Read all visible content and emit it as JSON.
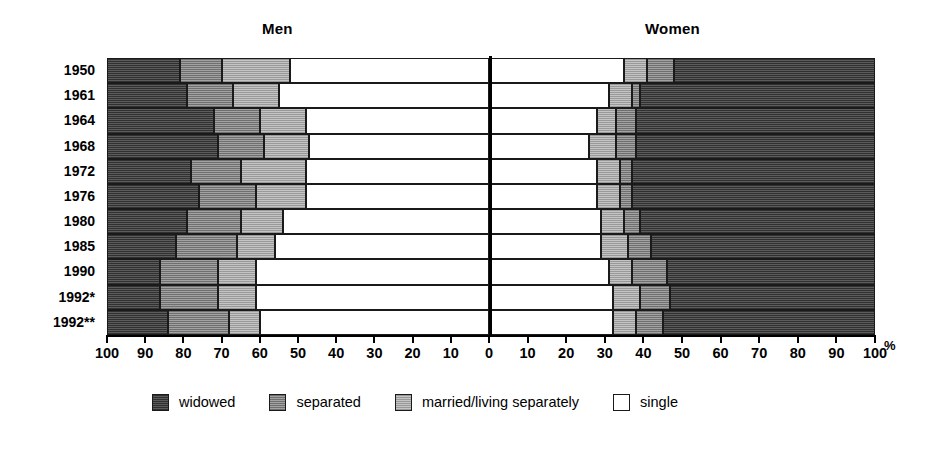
{
  "titles": {
    "men": "Men",
    "women": "Women"
  },
  "axis": {
    "percent_symbol": "%",
    "left_ticks": [
      "100",
      "90",
      "80",
      "70",
      "60",
      "50",
      "40",
      "30",
      "20",
      "10"
    ],
    "right_ticks": [
      "0",
      "10",
      "20",
      "30",
      "40",
      "50",
      "60",
      "70",
      "80",
      "90",
      "100"
    ]
  },
  "legend": {
    "items": [
      {
        "label": "widowed",
        "key": "widowed",
        "color": "#4a4a4a"
      },
      {
        "label": "separated",
        "key": "separated",
        "color": "#8e8e8e"
      },
      {
        "label": "married/living separately",
        "key": "married",
        "color": "#b4b4b4"
      },
      {
        "label": "single",
        "key": "single",
        "color": "#ffffff"
      }
    ]
  },
  "chart_data": {
    "type": "bar",
    "title": "",
    "subtitle": "",
    "xlabel": "%",
    "ylabel": "",
    "orientation": "horizontal",
    "stacked": true,
    "layout": "diverging-pyramid",
    "grid": false,
    "legend_position": "bottom",
    "xlim_left": [
      0,
      100
    ],
    "xlim_right": [
      0,
      100
    ],
    "categories": [
      "1950",
      "1961",
      "1964",
      "1968",
      "1972",
      "1976",
      "1980",
      "1985",
      "1990",
      "1992*",
      "1992**"
    ],
    "series_order_men": [
      "widowed",
      "separated",
      "married",
      "single"
    ],
    "series_order_women": [
      "single",
      "married",
      "separated",
      "widowed"
    ],
    "men": {
      "widowed": [
        19,
        21,
        28,
        29,
        22,
        24,
        21,
        18,
        14,
        14,
        16
      ],
      "separated": [
        11,
        12,
        12,
        12,
        13,
        15,
        14,
        16,
        15,
        15,
        16
      ],
      "married": [
        18,
        12,
        12,
        12,
        17,
        13,
        11,
        10,
        10,
        10,
        8
      ],
      "single": [
        52,
        55,
        48,
        47,
        48,
        48,
        54,
        56,
        61,
        61,
        60
      ]
    },
    "women": {
      "single": [
        35,
        31,
        28,
        26,
        28,
        28,
        29,
        29,
        31,
        32,
        32
      ],
      "married": [
        6,
        6,
        5,
        7,
        6,
        6,
        6,
        7,
        6,
        7,
        6
      ],
      "separated": [
        7,
        2,
        5,
        5,
        3,
        3,
        4,
        6,
        9,
        8,
        7
      ],
      "widowed": [
        52,
        61,
        62,
        62,
        63,
        63,
        61,
        58,
        54,
        53,
        55
      ]
    }
  }
}
